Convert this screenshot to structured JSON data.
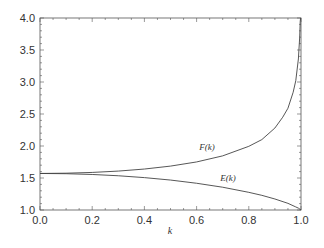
{
  "chart_data": {
    "type": "line",
    "title": "",
    "xlabel": "k",
    "ylabel": "",
    "xlim": [
      0.0,
      1.0
    ],
    "ylim": [
      1.0,
      4.0
    ],
    "grid": false,
    "legend": "none (inline curve labels)",
    "x_ticks": [
      "0.0",
      "0.2",
      "0.4",
      "0.6",
      "0.8",
      "1.0"
    ],
    "y_ticks": [
      "1.0",
      "1.5",
      "2.0",
      "2.5",
      "3.0",
      "3.5",
      "4.0"
    ],
    "series": [
      {
        "name": "F(k)",
        "x": [
          0.0,
          0.1,
          0.2,
          0.3,
          0.4,
          0.5,
          0.6,
          0.7,
          0.8,
          0.85,
          0.9,
          0.93,
          0.95,
          0.97,
          0.98,
          0.99,
          0.995,
          0.997
        ],
        "y": [
          1.571,
          1.575,
          1.587,
          1.608,
          1.64,
          1.686,
          1.751,
          1.846,
          1.995,
          2.1,
          2.281,
          2.45,
          2.59,
          2.84,
          3.02,
          3.36,
          3.7,
          3.95
        ]
      },
      {
        "name": "E(k)",
        "x": [
          0.0,
          0.1,
          0.2,
          0.3,
          0.4,
          0.5,
          0.6,
          0.7,
          0.8,
          0.85,
          0.9,
          0.95,
          0.98,
          0.99,
          1.0
        ],
        "y": [
          1.571,
          1.567,
          1.555,
          1.535,
          1.506,
          1.468,
          1.418,
          1.356,
          1.276,
          1.229,
          1.172,
          1.104,
          1.048,
          1.029,
          1.0
        ]
      }
    ],
    "annotations": [
      {
        "text": "F(k)",
        "x": 0.64,
        "y": 1.93
      },
      {
        "text": "E(k)",
        "x": 0.72,
        "y": 1.45
      }
    ]
  }
}
